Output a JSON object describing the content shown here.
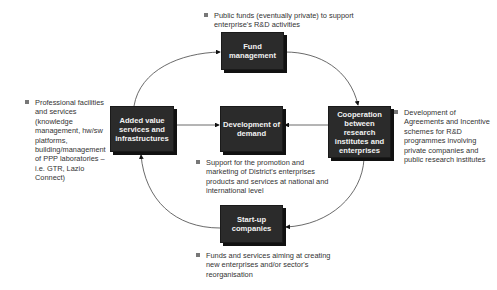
{
  "diagram": {
    "nodes": {
      "fund": {
        "label": "Fund management"
      },
      "added": {
        "label": "Added value services and infrastructures"
      },
      "demand": {
        "label": "Development of demand"
      },
      "coop": {
        "label": "Cooperation between research institutes and enterprises"
      },
      "startup": {
        "label": "Start-up companies"
      }
    },
    "notes": {
      "fund": "Public funds (eventually private) to support enterprise's R&D activities",
      "added": "Professional facilities and services (knowledge management, hw/sw platforms, building/management of PPP laboratories – i.e. GTR, Lazio Connect)",
      "demand": "Support for the promotion and marketing of District's enterprises products and services at national and international level",
      "coop": "Development of Agreements and Incentive schemes for R&D programmes involving private companies and public research institutes",
      "startup": "Funds and services aiming at creating new enterprises and/or sector's reorganisation"
    },
    "edges": [
      {
        "from": "added",
        "to": "fund"
      },
      {
        "from": "fund",
        "to": "coop"
      },
      {
        "from": "coop",
        "to": "startup"
      },
      {
        "from": "startup",
        "to": "added"
      },
      {
        "from": "added",
        "to": "demand"
      },
      {
        "from": "coop",
        "to": "demand"
      }
    ],
    "colors": {
      "box": "#2b2b2b",
      "box_text": "#f2f2f2",
      "line": "#444444",
      "bullet": "#777777"
    }
  }
}
